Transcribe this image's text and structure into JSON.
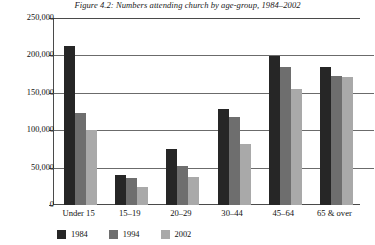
{
  "chart_data": {
    "type": "bar",
    "title": "Figure 4.2: Numbers attending church by age-group, 1984–2002",
    "xlabel": "",
    "ylabel": "",
    "categories": [
      "Under 15",
      "15–19",
      "20–29",
      "30–44",
      "45–64",
      "65 & over"
    ],
    "series": [
      {
        "name": "1984",
        "color": "#262626",
        "values": [
          213000,
          40000,
          75000,
          128000,
          199000,
          185000
        ]
      },
      {
        "name": "1994",
        "color": "#6e6e6e",
        "values": [
          123000,
          36000,
          52000,
          118000,
          184000,
          173000
        ]
      },
      {
        "name": "2002",
        "color": "#a9a9a9",
        "values": [
          100000,
          24000,
          37000,
          81000,
          155000,
          171000
        ]
      }
    ],
    "ylim": [
      0,
      250000
    ],
    "ytick_values": [
      0,
      50000,
      100000,
      150000,
      200000,
      250000
    ],
    "ytick_labels": [
      "0",
      "50,000",
      "100,000",
      "150,000",
      "200,000",
      "250,000"
    ],
    "grid": true,
    "legend_position": "bottom-left"
  }
}
